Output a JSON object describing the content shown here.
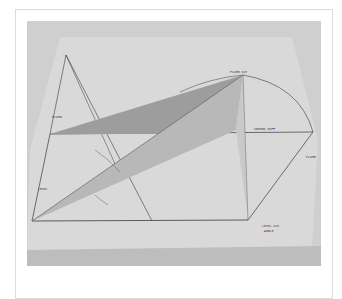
{
  "image": {
    "description": "Photograph of a cardboard/paper geometric roof-framing model with folded triangular planes and handwritten labels",
    "labels": {
      "level_cut_angle": "LEVEL CUT ANGLE",
      "common_diff": "COMMON DIFF",
      "common_run": "COMMON RUN",
      "plumb_cut": "PLUMB CUT",
      "plumb_rise": "PLUMB RISE",
      "level_cut_angle_left": "LEVEL CUT ANGLE",
      "plumb_cut_top": "PLUMB CUT",
      "top_label": "PLUMB CUT"
    },
    "colors": {
      "background": "#c9c9c9",
      "board": "#d8d8d8",
      "plane_dark": "#9a9a9a",
      "plane_mid": "#b5b5b5",
      "plane_light": "#c8c8c8",
      "line": "#3a3a3a"
    }
  }
}
